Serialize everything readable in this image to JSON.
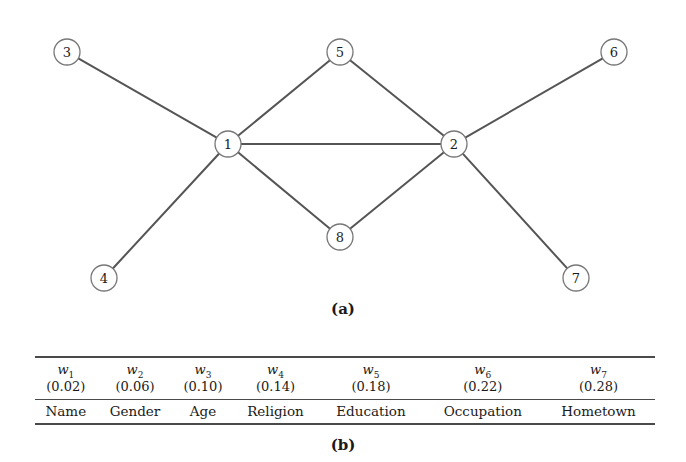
{
  "figure": {
    "panel_a_caption": "(a)",
    "panel_b_caption": "(b)"
  },
  "graph": {
    "stroke_color": "#555555",
    "node_fill": "#ffffff",
    "node_stroke": "#777777",
    "node_radius": 13,
    "nodes": [
      {
        "id": "1",
        "label": "1",
        "cx": 228,
        "cy": 144
      },
      {
        "id": "2",
        "label": "2",
        "cx": 454,
        "cy": 144
      },
      {
        "id": "3",
        "label": "3",
        "cx": 67,
        "cy": 52
      },
      {
        "id": "4",
        "label": "4",
        "cx": 104,
        "cy": 278
      },
      {
        "id": "5",
        "label": "5",
        "cx": 340,
        "cy": 52
      },
      {
        "id": "6",
        "label": "6",
        "cx": 614,
        "cy": 52
      },
      {
        "id": "7",
        "label": "7",
        "cx": 576,
        "cy": 278
      },
      {
        "id": "8",
        "label": "8",
        "cx": 340,
        "cy": 237
      }
    ],
    "edges": [
      {
        "source": "3",
        "target": "1"
      },
      {
        "source": "4",
        "target": "1"
      },
      {
        "source": "5",
        "target": "1"
      },
      {
        "source": "1",
        "target": "2"
      },
      {
        "source": "1",
        "target": "8"
      },
      {
        "source": "5",
        "target": "2"
      },
      {
        "source": "6",
        "target": "2"
      },
      {
        "source": "7",
        "target": "2"
      },
      {
        "source": "8",
        "target": "2"
      }
    ]
  },
  "table": {
    "weight_symbols": [
      "w",
      "w",
      "w",
      "w",
      "w",
      "w",
      "w"
    ],
    "weight_subscripts": [
      "1",
      "2",
      "3",
      "4",
      "5",
      "6",
      "7"
    ],
    "weight_values": [
      "(0.02)",
      "(0.06)",
      "(0.10)",
      "(0.14)",
      "(0.18)",
      "(0.22)",
      "(0.28)"
    ],
    "attributes": [
      "Name",
      "Gender",
      "Age",
      "Religion",
      "Education",
      "Occupation",
      "Hometown"
    ]
  },
  "chart_data": {
    "type": "bar",
    "title": "",
    "xlabel": "",
    "ylabel": "Weight",
    "categories": [
      "Name",
      "Gender",
      "Age",
      "Religion",
      "Education",
      "Occupation",
      "Hometown"
    ],
    "series": [
      {
        "name": "Attribute weight",
        "values": [
          0.02,
          0.06,
          0.1,
          0.14,
          0.18,
          0.22,
          0.28
        ]
      }
    ],
    "value_labels": [
      "w1",
      "w2",
      "w3",
      "w4",
      "w5",
      "w6",
      "w7"
    ],
    "ylim": [
      0,
      0.3
    ],
    "grid": false,
    "legend": "none",
    "graph_structure": {
      "type": "undirected-graph",
      "node_count": 8,
      "nodes": [
        "1",
        "2",
        "3",
        "4",
        "5",
        "6",
        "7",
        "8"
      ],
      "edges": [
        [
          "3",
          "1"
        ],
        [
          "4",
          "1"
        ],
        [
          "5",
          "1"
        ],
        [
          "1",
          "2"
        ],
        [
          "1",
          "8"
        ],
        [
          "5",
          "2"
        ],
        [
          "6",
          "2"
        ],
        [
          "7",
          "2"
        ],
        [
          "8",
          "2"
        ]
      ],
      "degrees": {
        "1": 5,
        "2": 5,
        "3": 1,
        "4": 1,
        "5": 2,
        "6": 1,
        "7": 1,
        "8": 2
      }
    }
  }
}
